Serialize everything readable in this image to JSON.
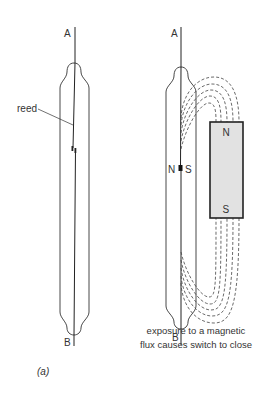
{
  "figure": {
    "panel_label": "(a)",
    "left_switch": {
      "terminal_top": "A",
      "terminal_bottom": "B",
      "callout": "reed",
      "state": "open"
    },
    "right_switch": {
      "terminal_top": "A",
      "terminal_bottom": "B",
      "contact_pole_left": "N",
      "contact_pole_right": "S",
      "state": "closed"
    },
    "magnet": {
      "pole_top": "N",
      "pole_bottom": "S",
      "fill_color": "#e2e2e2",
      "stroke_color": "#222222"
    },
    "caption": {
      "line1": "exposure to a magnetic",
      "line2": "flux causes switch to close"
    }
  }
}
